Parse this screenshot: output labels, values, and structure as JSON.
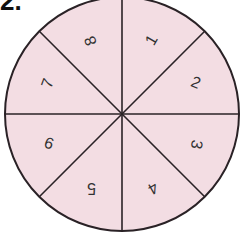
{
  "problem_label": "2.",
  "spinner": {
    "fill_color": "#f3dde3",
    "line_color": "#2a2226",
    "center": [
      122,
      114
    ],
    "radius": 117,
    "sections": [
      {
        "label": "1",
        "angle_deg": -67.5,
        "rotation": -60
      },
      {
        "label": "2",
        "angle_deg": -22.5,
        "rotation": 22
      },
      {
        "label": "3",
        "angle_deg": 22.5,
        "rotation": 100
      },
      {
        "label": "4",
        "angle_deg": 67.5,
        "rotation": 150
      },
      {
        "label": "5",
        "angle_deg": 112.5,
        "rotation": 180
      },
      {
        "label": "6",
        "angle_deg": 157.5,
        "rotation": 20
      },
      {
        "label": "7",
        "angle_deg": 202.5,
        "rotation": -70
      },
      {
        "label": "8",
        "angle_deg": 247.5,
        "rotation": -110
      }
    ]
  }
}
